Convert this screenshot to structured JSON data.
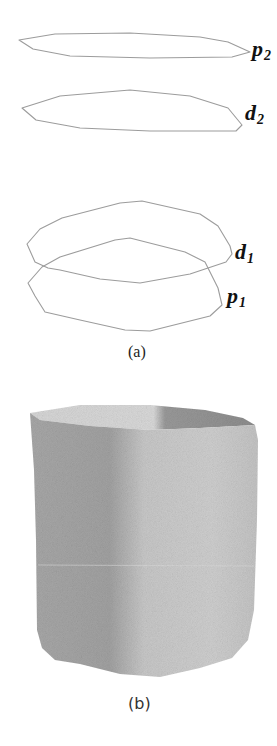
{
  "figure": {
    "panel_a": {
      "caption": "(a)",
      "contours": [
        {
          "id": "p2",
          "label_base": "p",
          "label_sub": "2"
        },
        {
          "id": "d2",
          "label_base": "d",
          "label_sub": "2"
        },
        {
          "id": "d1",
          "label_base": "d",
          "label_sub": "1"
        },
        {
          "id": "p1",
          "label_base": "p",
          "label_sub": "1"
        }
      ]
    },
    "panel_b": {
      "caption": "(b)",
      "description": "grey shaded 3D surface reconstructed between contours",
      "colors": {
        "light": "#d2d2d2",
        "mid": "#b4b4b4",
        "dark": "#9a9a9a",
        "top_inner": "#8e8e8e"
      }
    },
    "stroke_color": "#9c9c9c"
  }
}
